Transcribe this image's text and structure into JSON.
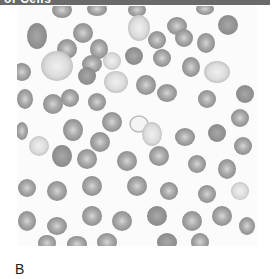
{
  "header": {
    "title": "of Cells",
    "background": "#6a6a6a"
  },
  "figure": {
    "panel_label": "B",
    "colors": {
      "background": "#fbfbfb",
      "cell_fill": "#9a9a9a",
      "cell_center": "#d8d8d8",
      "cell_edge": "#888888"
    }
  }
}
